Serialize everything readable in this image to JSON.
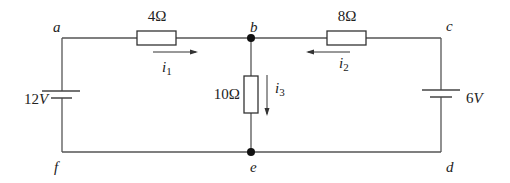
{
  "circuit": {
    "nodes": {
      "a": {
        "label": "a"
      },
      "b": {
        "label": "b"
      },
      "c": {
        "label": "c"
      },
      "d": {
        "label": "d"
      },
      "e": {
        "label": "e"
      },
      "f": {
        "label": "f"
      }
    },
    "resistors": {
      "r_ab": {
        "label": "4Ω",
        "value": "4 ohm",
        "between": "a-b"
      },
      "r_bc": {
        "label": "8Ω",
        "value": "8 ohm",
        "between": "b-c"
      },
      "r_be": {
        "label": "10Ω",
        "value": "10 ohm",
        "between": "b-e"
      }
    },
    "sources": {
      "left": {
        "label": "12V",
        "value_num": "12",
        "unit": "V",
        "between": "a-f"
      },
      "right": {
        "label": "6V",
        "value_num": "6",
        "unit": "V",
        "between": "c-d"
      }
    },
    "currents": {
      "i1": {
        "symbol": "i",
        "sub": "1",
        "direction": "a to b"
      },
      "i2": {
        "symbol": "i",
        "sub": "2",
        "direction": "c to b"
      },
      "i3": {
        "symbol": "i",
        "sub": "3",
        "direction": "b to e"
      }
    }
  }
}
